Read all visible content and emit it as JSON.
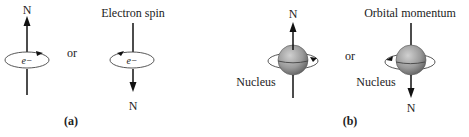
{
  "panel_a": {
    "up_label": "N",
    "electron_label": "e−",
    "or_label": "or",
    "title": "Electron spin",
    "down_label": "N",
    "caption": "(a)"
  },
  "panel_b": {
    "up_label": "N",
    "nucleus_label_left": "Nucleus",
    "or_label": "or",
    "title": "Orbital momentum",
    "nucleus_label_right": "Nucleus",
    "down_label": "N",
    "caption": "(b)"
  },
  "colors": {
    "ink": "#111111",
    "sphere_light": "#c8c8c8",
    "sphere_dark": "#6e6e6e"
  }
}
